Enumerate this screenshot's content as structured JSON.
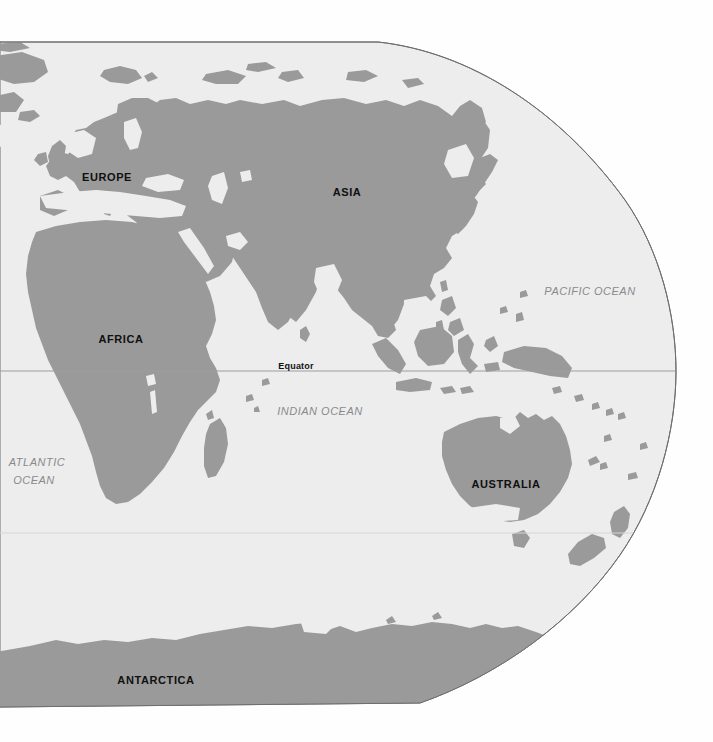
{
  "map": {
    "title": "World Map",
    "projection": "oval-equal-area",
    "colors": {
      "land": "#9a9a9a",
      "ocean": "#ededed",
      "background": "#fefefe",
      "border": "#6e6e6e",
      "graticule": "#9d9d9d",
      "label_dark": "#101010",
      "label_ocean": "#8a8a8a"
    },
    "continent_labels": [
      {
        "name": "europe",
        "text": "EUROPE",
        "x": 107,
        "y": 178,
        "size": 11
      },
      {
        "name": "asia",
        "text": "ASIA",
        "x": 347,
        "y": 193,
        "size": 11
      },
      {
        "name": "africa",
        "text": "AFRICA",
        "x": 121,
        "y": 340,
        "size": 11
      },
      {
        "name": "australia",
        "text": "AUSTRALIA",
        "x": 506,
        "y": 485,
        "size": 11
      },
      {
        "name": "antarctica",
        "text": "ANTARCTICA",
        "x": 156,
        "y": 681,
        "size": 11
      }
    ],
    "ocean_labels": [
      {
        "name": "pacific-ocean",
        "lines": [
          "PACIFIC OCEAN"
        ],
        "x": 590,
        "y": 292,
        "size": 11
      },
      {
        "name": "indian-ocean",
        "lines": [
          "INDIAN OCEAN"
        ],
        "x": 320,
        "y": 412,
        "size": 11
      },
      {
        "name": "atlantic-ocean",
        "lines": [
          "ATLANTIC",
          "OCEAN"
        ],
        "x": 37,
        "y": 463,
        "size": 11
      }
    ],
    "graticule": {
      "equator": {
        "label": "Equator",
        "label_x": 296,
        "label_y": 367,
        "line_y": 371
      },
      "tropic_south": {
        "label": "",
        "line_y": 533
      }
    }
  }
}
